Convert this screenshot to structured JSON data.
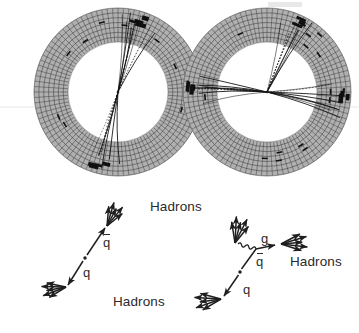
{
  "figure": {
    "kind": "particle-physics-event-display-figure",
    "background_color": "#ffffff",
    "ink_color": "#1a1a1a",
    "detector_fill": "#b3b3b3",
    "width": 359,
    "height": 333
  },
  "event_displays": [
    {
      "id": "two-jet-event",
      "name": "Two-jet event display",
      "center_x": 118,
      "center_y": 92,
      "outer_radius": 84,
      "inner_radius": 50,
      "n_sectors": 96,
      "n_rings": 7,
      "jets": 2,
      "jet_axes_deg": [
        -73,
        104
      ],
      "tracks_per_jet": [
        9,
        7
      ],
      "calorimeter_hits": 10
    },
    {
      "id": "three-jet-event",
      "name": "Three-jet event display",
      "center_x": 267,
      "center_y": 92,
      "outer_radius": 84,
      "inner_radius": 50,
      "n_sectors": 96,
      "n_rings": 7,
      "jets": 3,
      "jet_axes_deg": [
        -66,
        5,
        186
      ],
      "tracks_per_jet": [
        7,
        8,
        9
      ],
      "calorimeter_hits": 13
    }
  ],
  "parton_diagrams": [
    {
      "id": "qqbar-diagram",
      "name": "quark antiquark two jet diagram",
      "vertex_x": 85,
      "vertex_y": 258,
      "labels": {
        "antiquark": "q",
        "antiquark_has_bar": true,
        "quark": "q"
      },
      "hadron_labels": [
        "Hadrons",
        "Hadrons"
      ],
      "jet_count": 2
    },
    {
      "id": "qqbarg-diagram",
      "name": "quark antiquark gluon three jet diagram",
      "vertex_x": 240,
      "vertex_y": 272,
      "gluon_vertex_x": 258,
      "gluon_vertex_y": 247,
      "labels": {
        "gluon": "g",
        "antiquark": "q",
        "antiquark_has_bar": true,
        "quark": "q"
      },
      "hadron_labels": [
        "Hadrons"
      ],
      "jet_count": 3
    }
  ],
  "text_labels": [
    {
      "id": "hadrons-top-left",
      "text": "Hadrons",
      "x": 150,
      "y": 207
    },
    {
      "id": "hadrons-bottom-left",
      "text": "Hadrons",
      "x": 113,
      "y": 302
    },
    {
      "id": "hadrons-right",
      "text": "Hadrons",
      "x": 290,
      "y": 262
    },
    {
      "id": "antiquark-left",
      "text": "q",
      "x": 103,
      "y": 242,
      "bar": true
    },
    {
      "id": "quark-left",
      "text": "q",
      "x": 83,
      "y": 272,
      "bar": false
    },
    {
      "id": "gluon-right",
      "text": "g",
      "x": 261,
      "y": 238,
      "bar": false
    },
    {
      "id": "antiquark-right",
      "text": "q",
      "x": 256,
      "y": 261,
      "bar": true
    },
    {
      "id": "quark-right",
      "text": "q",
      "x": 243,
      "y": 289,
      "bar": false
    }
  ]
}
